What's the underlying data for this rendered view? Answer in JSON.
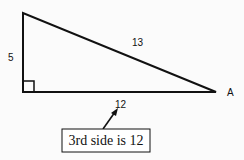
{
  "triangle": {
    "side_vertical_label": "5",
    "hypotenuse_label": "13",
    "side_base_label": "12",
    "vertex_label": "A",
    "right_angle": true
  },
  "callout": {
    "text": "3rd side is 12"
  },
  "colors": {
    "stroke": "#111111",
    "background": "#fbfbfb"
  }
}
